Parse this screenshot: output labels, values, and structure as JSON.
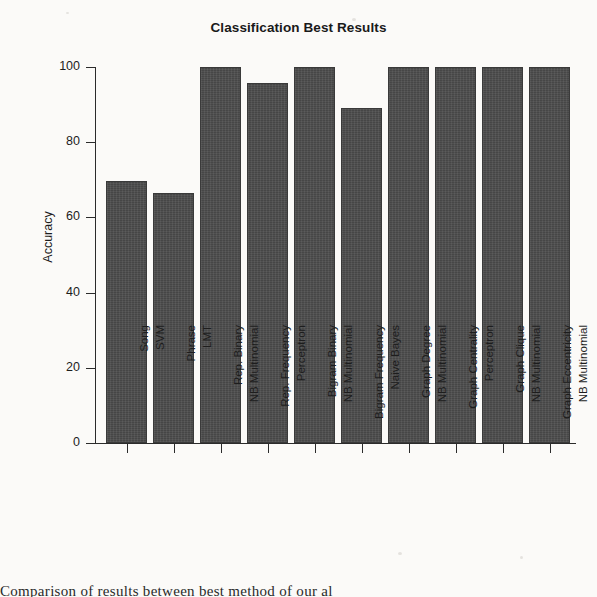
{
  "chart_data": {
    "type": "bar",
    "title": "Classification Best Results",
    "xlabel": "",
    "ylabel": "Accuracy",
    "ylim": [
      0,
      100
    ],
    "yticks": [
      0,
      20,
      40,
      60,
      80,
      100
    ],
    "grid": false,
    "legend": null,
    "bar_color": "#4b4b4b",
    "categories": [
      "Song SVM",
      "Phrase LMT",
      "Rep. Binary NB Multinomial",
      "Rep. Frequency Perceptron",
      "Bigram Binary NB Multinomial",
      "Bigram Frequency Naive Bayes",
      "Graph Degree NB Multinomial",
      "Graph Centrality Perceptron",
      "Graph Clique NB Multinomial",
      "Graph Eccentricity NB Multinomial"
    ],
    "category_lines": [
      {
        "line1": "Song",
        "line2": "SVM"
      },
      {
        "line1": "Phrase",
        "line2": "LMT"
      },
      {
        "line1": "Rep. Binary",
        "line2": "NB Multinomial"
      },
      {
        "line1": "Rep. Frequency",
        "line2": "Perceptron"
      },
      {
        "line1": "Bigram Binary",
        "line2": "NB Multinomial"
      },
      {
        "line1": "Bigram Frequency",
        "line2": "Naive Bayes"
      },
      {
        "line1": "Graph Degree",
        "line2": "NB Multinomial"
      },
      {
        "line1": "Graph Centrality",
        "line2": "Perceptron"
      },
      {
        "line1": "Graph Clique",
        "line2": "NB Multinomial"
      },
      {
        "line1": "Graph Eccentricity",
        "line2": "NB Multinomial"
      }
    ],
    "values": [
      69.8,
      66.5,
      100,
      95.8,
      100,
      89.2,
      100,
      100,
      100,
      100
    ]
  },
  "axis": {
    "y_tick_labels": [
      "0",
      "20",
      "40",
      "60",
      "80",
      "100"
    ],
    "y_title": "Accuracy"
  },
  "page": {
    "caption_fragment": "Comparison of results between best method of our al"
  }
}
